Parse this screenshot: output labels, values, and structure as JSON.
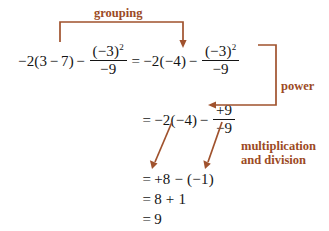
{
  "figure": {
    "background_color": "#ffffff",
    "math_color": "#141414",
    "annotation_color": "#a0522d"
  },
  "equation_lines": [
    {
      "id": "line1",
      "lhs": {
        "leading": "−2(3",
        "op1": "−",
        "after_op1": "7)",
        "op2": "−",
        "fraction": {
          "numerator_base": "(−3)",
          "numerator_exponent": "2",
          "denominator": "−9"
        }
      },
      "equals": "=",
      "rhs": {
        "leading": "−2(−4)",
        "op": "−",
        "fraction": {
          "numerator_base": "(−3)",
          "numerator_exponent": "2",
          "denominator": "−9"
        }
      }
    },
    {
      "id": "line2",
      "equals": "=",
      "leading": "−2(−4)",
      "op": "−",
      "fraction": {
        "numerator": "+9",
        "denominator": "−9"
      }
    },
    {
      "id": "line3",
      "equals": "=",
      "text": "+8 − (−1)"
    },
    {
      "id": "line4",
      "equals": "=",
      "text": "8 + 1"
    },
    {
      "id": "line5",
      "equals": "=",
      "text": "9"
    }
  ],
  "annotations": [
    {
      "id": "grouping",
      "label": "grouping"
    },
    {
      "id": "power",
      "label": "power"
    },
    {
      "id": "multiplication-and-division",
      "label_line1": "multiplication",
      "label_line2": "and division"
    }
  ]
}
